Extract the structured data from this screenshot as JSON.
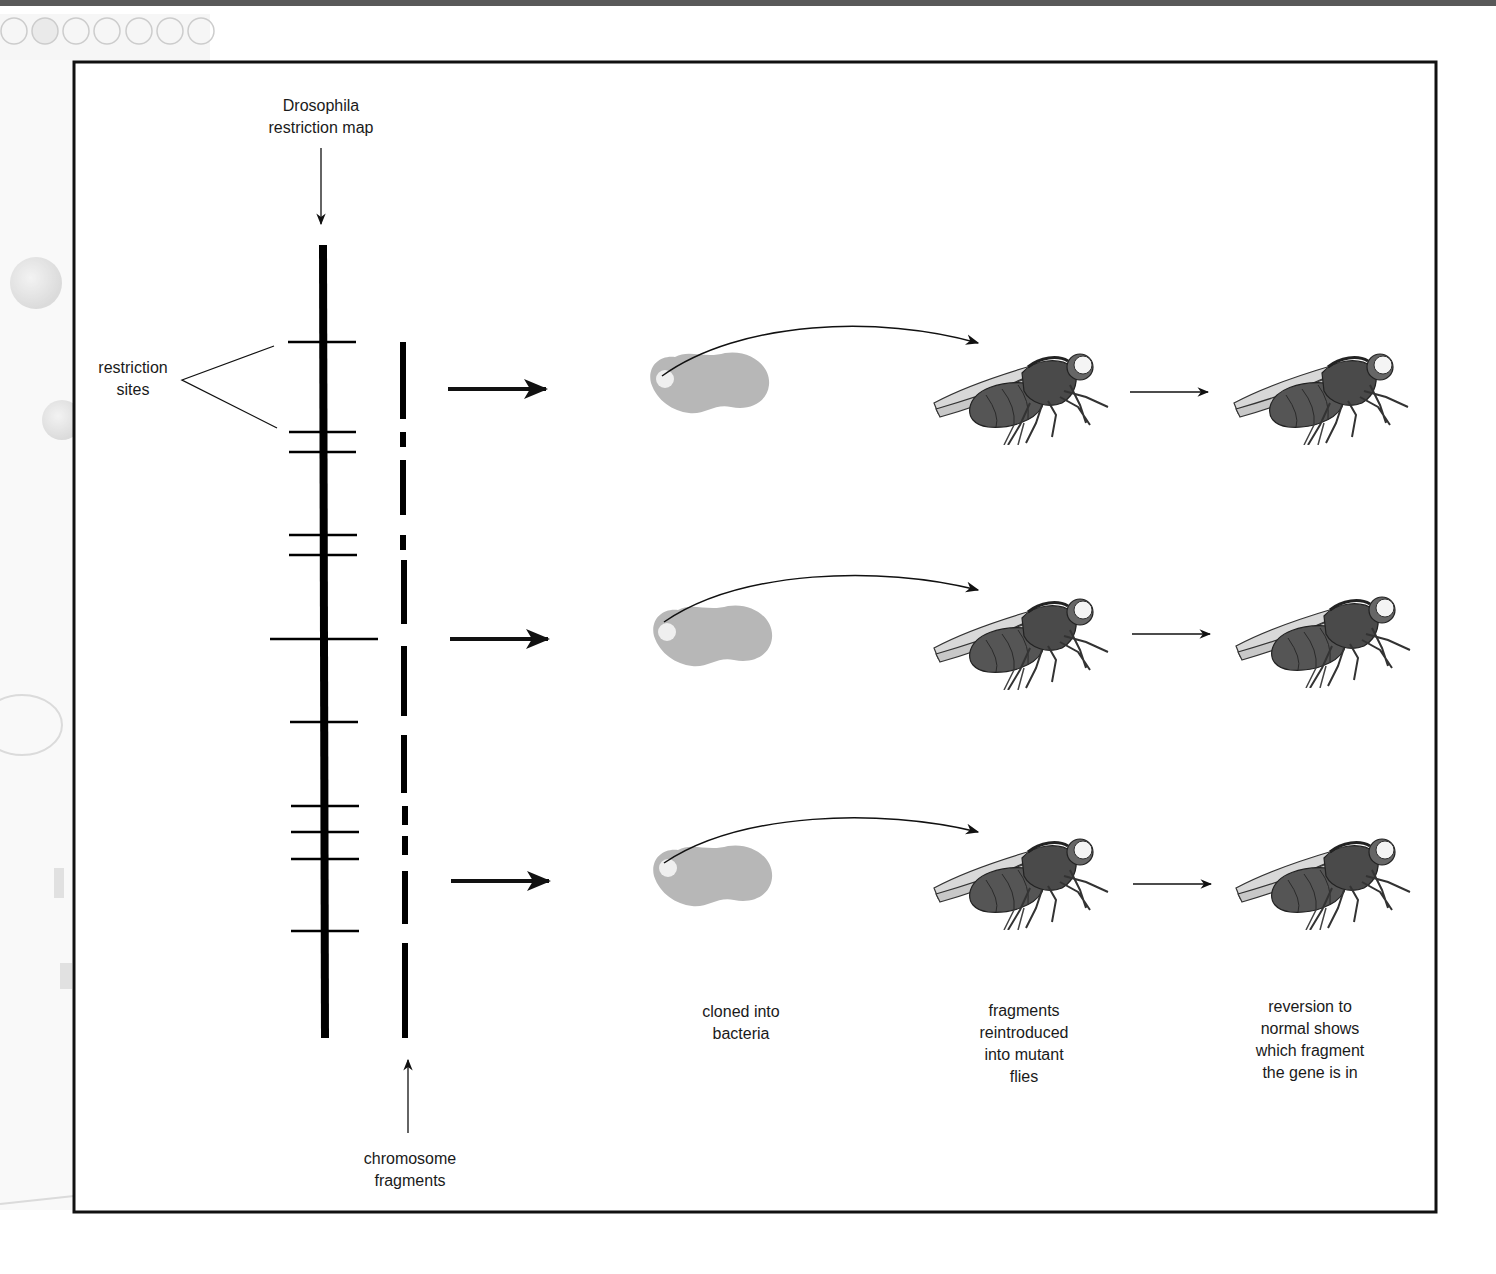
{
  "figure": {
    "frame": {
      "x": 74,
      "y": 62,
      "width": 1362,
      "height": 1150,
      "stroke": "#111111"
    },
    "colors": {
      "ink": "#111111",
      "bacteria_fill": "#b7b7b7",
      "plasmid_fill": "#eeeeee",
      "fly_body": "#555555",
      "page_decor": "#d4d4d4"
    }
  },
  "labels": {
    "restriction_map": [
      "Drosophila",
      "restriction map"
    ],
    "restriction_sites": [
      "restriction",
      "sites"
    ],
    "chromosome_fragments": [
      "chromosome",
      "fragments"
    ],
    "cloned_into_bacteria": [
      "cloned into",
      "bacteria"
    ],
    "fragments_reintroduced": [
      "fragments",
      "reintroduced",
      "into mutant",
      "flies"
    ],
    "reversion": [
      "reversion to",
      "normal shows",
      "which fragment",
      "the gene is in"
    ]
  },
  "restriction_map": {
    "x": 323,
    "y_top": 245,
    "y_bottom": 1038,
    "sites_y": [
      342,
      432,
      452,
      535,
      555,
      639,
      722,
      806,
      832,
      859,
      931
    ]
  },
  "fragments": {
    "x": 404,
    "segments": [
      [
        342,
        419
      ],
      [
        432,
        447
      ],
      [
        460,
        515
      ],
      [
        535,
        550
      ],
      [
        560,
        624
      ],
      [
        646,
        716
      ],
      [
        735,
        793
      ],
      [
        806,
        825
      ],
      [
        836,
        855
      ],
      [
        871,
        924
      ],
      [
        943,
        1038
      ]
    ]
  },
  "rows": [
    {
      "id": "row-1",
      "arrow_y": 389,
      "bacteria_cy": 377,
      "fly_y": 390
    },
    {
      "id": "row-2",
      "arrow_y": 639,
      "bacteria_cy": 628,
      "fly_y": 635
    },
    {
      "id": "row-3",
      "arrow_y": 881,
      "bacteria_cy": 870,
      "fly_y": 878
    }
  ],
  "icons": {
    "bacterium": "bacterium-blob-icon",
    "plasmid": "plasmid-dot-icon",
    "fly": "drosophila-fly-icon",
    "arrow": "right-arrow-icon"
  }
}
